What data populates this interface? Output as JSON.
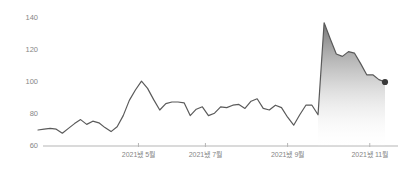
{
  "chart_data": {
    "type": "line",
    "title": "",
    "subtitle": "",
    "xlabel": "",
    "ylabel": "",
    "ylim": [
      60,
      140
    ],
    "yticks": [
      60,
      80,
      100,
      120,
      140
    ],
    "ytick_labels": [
      "60",
      "80",
      "100",
      "120",
      "140"
    ],
    "xtick_labels": [
      "2021뇄 5월",
      "2021뇄 7월",
      "2021뇄 9월",
      "2021뇄 11월"
    ],
    "xticks": [
      "2021-05",
      "2021-07",
      "2021-09",
      "2021-11"
    ],
    "grid": false,
    "legend": "none",
    "line_color": "#5a5a5a",
    "axis_color": "#b5b5b5",
    "tick_label_color": "#868686",
    "marker_color": "#3a3a3a",
    "area_fill_top_color": "#7a7a7a",
    "area_fill_bottom_color": "#ffffff",
    "area_fill_start_index": 46,
    "end_marker_value": 100,
    "series": [
      {
        "name": "value",
        "values": [
          70.0,
          70.5,
          71.0,
          70.5,
          68.0,
          71.0,
          74.0,
          76.5,
          73.5,
          75.5,
          74.5,
          71.5,
          69.0,
          72.0,
          79.0,
          88.5,
          95.0,
          100.5,
          96.0,
          89.0,
          82.5,
          86.5,
          87.5,
          87.5,
          87.0,
          79.0,
          83.0,
          84.5,
          79.0,
          80.5,
          84.5,
          84.0,
          85.5,
          86.0,
          83.5,
          88.0,
          89.5,
          83.5,
          82.5,
          85.5,
          84.0,
          78.0,
          73.0,
          79.5,
          85.5,
          85.5,
          79.5,
          137.0,
          127.0,
          117.5,
          116.0,
          119.0,
          118.0,
          111.5,
          104.5,
          104.5,
          101.5,
          100.0
        ]
      }
    ]
  }
}
